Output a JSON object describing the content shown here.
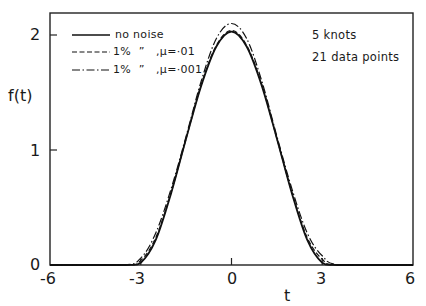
{
  "chart_data": {
    "type": "line",
    "title": "",
    "xlabel": "t",
    "ylabel": "f(t)",
    "xlim": [
      -6,
      6
    ],
    "ylim": [
      0,
      2.2
    ],
    "grid": false,
    "legend_position": "upper left",
    "x_ticks": [
      -6,
      -3,
      0,
      3,
      6
    ],
    "x_tick_labels": [
      "-6",
      "-3",
      "0",
      "3",
      "6"
    ],
    "y_ticks": [
      0,
      1,
      2
    ],
    "y_tick_labels": [
      "0",
      "1",
      "2"
    ],
    "annotations": [
      "5 knots",
      "21 data points"
    ],
    "series": [
      {
        "name": "no noise",
        "style": "solid",
        "x": [
          -6,
          -3.5,
          -3,
          -2.5,
          -2,
          -1.5,
          -1,
          -0.5,
          0,
          0.5,
          1,
          1.5,
          2,
          2.5,
          3,
          3.5,
          6
        ],
        "y": [
          0,
          0,
          0.02,
          0.22,
          0.62,
          1.1,
          1.56,
          1.9,
          2.03,
          1.9,
          1.56,
          1.1,
          0.62,
          0.22,
          0.02,
          0,
          0
        ]
      },
      {
        "name": "1% noise, μ=.01",
        "legend_label": "1%  ”   ,μ=·01",
        "style": "dashed",
        "x": [
          -6,
          -3.5,
          -3,
          -2.5,
          -2,
          -1.5,
          -1,
          -0.5,
          0,
          0.5,
          1,
          1.5,
          2,
          2.5,
          3,
          3.5,
          6
        ],
        "y": [
          0,
          0,
          0.04,
          0.24,
          0.63,
          1.1,
          1.57,
          1.91,
          2.04,
          1.91,
          1.57,
          1.1,
          0.63,
          0.24,
          0.05,
          0,
          0
        ]
      },
      {
        "name": "1% noise, μ=.001",
        "legend_label": "1%  ”   ,μ=·001",
        "style": "dashdot",
        "x": [
          -6,
          -3.6,
          -3,
          -2.5,
          -2,
          -1.5,
          -1,
          -0.5,
          0,
          0.5,
          1,
          1.5,
          2,
          2.5,
          3,
          3.6,
          6
        ],
        "y": [
          0,
          0,
          0.06,
          0.28,
          0.66,
          1.12,
          1.6,
          1.97,
          2.1,
          1.97,
          1.6,
          1.12,
          0.66,
          0.28,
          0.08,
          0,
          0
        ]
      }
    ]
  },
  "legend": {
    "items": [
      {
        "label": "no noise"
      },
      {
        "label": "1%  ”   ,μ=·01"
      },
      {
        "label": "1%  ”   ,μ=·001"
      }
    ]
  },
  "annotation": {
    "knots": "5 knots",
    "points": "21 data points"
  },
  "axes": {
    "xlabel": "t",
    "ylabel": "f(t)",
    "x_ticks": [
      "-6",
      "-3",
      "0",
      "3",
      "6"
    ],
    "y_ticks": [
      "0",
      "1",
      "2"
    ]
  }
}
